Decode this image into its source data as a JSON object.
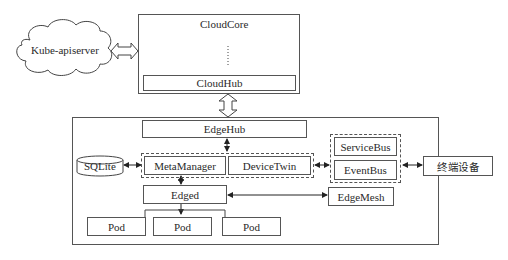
{
  "diagram": {
    "cloud": {
      "external": {
        "label": "Kube-apiserver",
        "shape": "cloud"
      },
      "core": {
        "title": "CloudCore",
        "ellipsis": "vertical-dots",
        "hub": "CloudHub"
      }
    },
    "edge": {
      "hub": "EdgeHub",
      "storage": {
        "label": "SQLite",
        "shape": "cylinder"
      },
      "managers": [
        "MetaManager",
        "DeviceTwin"
      ],
      "buses": [
        "ServiceBus",
        "EventBus"
      ],
      "engine": "Edged",
      "mesh": "EdgeMesh",
      "pods": [
        "Pod",
        "Pod",
        "Pod"
      ]
    },
    "device": {
      "label": "终端设备"
    },
    "connections": [
      {
        "from": "Kube-apiserver",
        "to": "CloudCore",
        "type": "block-double-arrow"
      },
      {
        "from": "CloudHub",
        "to": "EdgeHub",
        "type": "block-double-arrow"
      },
      {
        "from": "EdgeHub",
        "to": "MetaManager/DeviceTwin",
        "type": "double-arrow"
      },
      {
        "from": "SQLite",
        "to": "MetaManager",
        "type": "double-arrow"
      },
      {
        "from": "MetaManager",
        "to": "Edged",
        "type": "double-arrow"
      },
      {
        "from": "DeviceTwin",
        "to": "EventBus",
        "type": "double-arrow"
      },
      {
        "from": "Edged",
        "to": "EdgeMesh",
        "type": "double-arrow"
      },
      {
        "from": "Edged",
        "to": "Pod",
        "type": "arrow"
      },
      {
        "from": "EventBus",
        "to": "终端设备",
        "type": "double-arrow"
      }
    ]
  }
}
